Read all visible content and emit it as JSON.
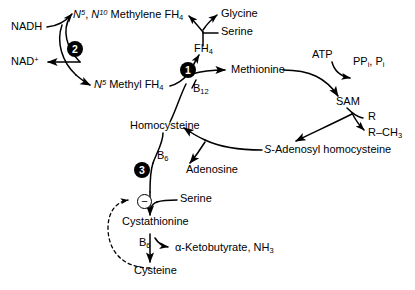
{
  "figure": {
    "caption_partial": ""
  },
  "metabolites": {
    "nadh": "NADH",
    "nad_plus": "NAD",
    "nad_plus_sup": "+",
    "methylene_fh4_n5": "N",
    "methylene_fh4_n5_sup": "5",
    "methylene_fh4_mid": ", ",
    "methylene_fh4_n10": "N",
    "methylene_fh4_n10_sup": "10",
    "methylene_fh4_rest": " Methylene FH",
    "methylene_fh4_sub": "4",
    "methyl_fh4_n5": "N",
    "methyl_fh4_n5_sup": "5",
    "methyl_fh4_rest": " Methyl FH",
    "methyl_fh4_sub": "4",
    "glycine": "Glycine",
    "serine_top": "Serine",
    "fh4": "FH",
    "fh4_sub": "4",
    "methionine": "Methionine",
    "b12": "B",
    "b12_sub": "12",
    "atp": "ATP",
    "ppi_pi_a": "PP",
    "ppi_pi_a_sub": "i",
    "ppi_pi_mid": ", P",
    "ppi_pi_b_sub": "i",
    "sam": "SAM",
    "r": "R",
    "r_ch3": "R",
    "r_ch3_dash": "–CH",
    "r_ch3_sub": "3",
    "sah_italic": "S",
    "sah_rest": "-Adenosyl homocysteine",
    "homocysteine": "Homocysteine",
    "adenosine": "Adenosine",
    "b6_upper": "B",
    "b6_upper_sub": "6",
    "serine_lower": "Serine",
    "cystathionine": "Cystathionine",
    "b6_lower": "B",
    "b6_lower_sub": "6",
    "ketobutyrate": "α-Ketobutyrate, NH",
    "ketobutyrate_sub": "3",
    "cysteine": "Cysteine"
  },
  "enzyme_steps": [
    {
      "number": "1",
      "name": "methionine-synthase"
    },
    {
      "number": "2",
      "name": "methylenetetrahydrofolate-reductase"
    },
    {
      "number": "3",
      "name": "cystathionine-beta-synthase"
    }
  ],
  "regulation": {
    "inhibition_symbol": "−",
    "inhibition_label": "feedback-inhibition"
  },
  "colors": {
    "stroke": "#000000",
    "background": "#ffffff",
    "badge_fill": "#000000",
    "badge_text": "#ffffff"
  }
}
